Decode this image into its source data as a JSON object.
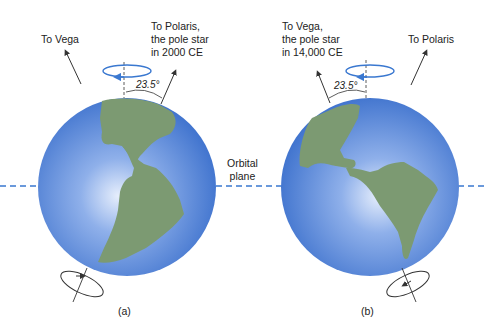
{
  "panel_a": {
    "caption": "(a)",
    "vega_label": "To Vega",
    "polaris_label": "To Polaris,\nthe pole star\nin 2000 CE",
    "angle": "23.5°"
  },
  "panel_b": {
    "caption": "(b)",
    "vega_label": "To Vega,\nthe pole star\nin 14,000 CE",
    "polaris_label": "To Polaris",
    "angle": "23.5°"
  },
  "orbital_plane_label": "Orbital\nplane",
  "colors": {
    "ocean": "#3f74d0",
    "ocean_light": "#dfe8fb",
    "land": "#7a9a70",
    "dash": "#3a78d0",
    "ring": "#3a78d0"
  }
}
